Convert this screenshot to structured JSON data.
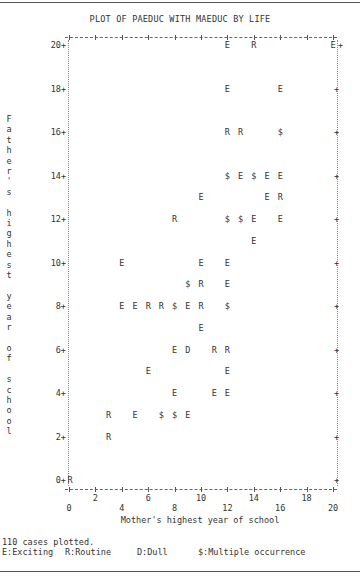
{
  "chart_data": {
    "type": "scatter",
    "title": "PLOT OF PAEDUC WITH MAEDUC BY LIFE",
    "xlabel": "Mother's highest year of school",
    "ylabel": "Father's highest year of school",
    "xlim": [
      0,
      20
    ],
    "ylim": [
      0,
      20
    ],
    "x_ticks": [
      0,
      2,
      4,
      6,
      8,
      10,
      12,
      14,
      16,
      18,
      20
    ],
    "y_ticks": [
      0,
      2,
      4,
      6,
      8,
      10,
      12,
      14,
      16,
      18,
      20
    ],
    "grid": false,
    "legend": [
      {
        "symbol": "E",
        "label": "Exciting"
      },
      {
        "symbol": "R",
        "label": "Routine"
      },
      {
        "symbol": "D",
        "label": "Dull"
      },
      {
        "symbol": "$",
        "label": "Multiple occurrence"
      }
    ],
    "points": [
      {
        "x": 12,
        "y": 20,
        "s": "E"
      },
      {
        "x": 14,
        "y": 20,
        "s": "R"
      },
      {
        "x": 20,
        "y": 20,
        "s": "E"
      },
      {
        "x": 12,
        "y": 18,
        "s": "E"
      },
      {
        "x": 16,
        "y": 18,
        "s": "E"
      },
      {
        "x": 12,
        "y": 16,
        "s": "R"
      },
      {
        "x": 13,
        "y": 16,
        "s": "R"
      },
      {
        "x": 16,
        "y": 16,
        "s": "$"
      },
      {
        "x": 12,
        "y": 14,
        "s": "$"
      },
      {
        "x": 13,
        "y": 14,
        "s": "E"
      },
      {
        "x": 14,
        "y": 14,
        "s": "$"
      },
      {
        "x": 15,
        "y": 14,
        "s": "E"
      },
      {
        "x": 16,
        "y": 14,
        "s": "E"
      },
      {
        "x": 10,
        "y": 13,
        "s": "E"
      },
      {
        "x": 15,
        "y": 13,
        "s": "E"
      },
      {
        "x": 16,
        "y": 13,
        "s": "R"
      },
      {
        "x": 8,
        "y": 12,
        "s": "R"
      },
      {
        "x": 12,
        "y": 12,
        "s": "$"
      },
      {
        "x": 13,
        "y": 12,
        "s": "$"
      },
      {
        "x": 14,
        "y": 12,
        "s": "E"
      },
      {
        "x": 16,
        "y": 12,
        "s": "E"
      },
      {
        "x": 14,
        "y": 11,
        "s": "E"
      },
      {
        "x": 4,
        "y": 10,
        "s": "E"
      },
      {
        "x": 10,
        "y": 10,
        "s": "E"
      },
      {
        "x": 12,
        "y": 10,
        "s": "E"
      },
      {
        "x": 9,
        "y": 9,
        "s": "$"
      },
      {
        "x": 10,
        "y": 9,
        "s": "R"
      },
      {
        "x": 12,
        "y": 9,
        "s": "E"
      },
      {
        "x": 4,
        "y": 8,
        "s": "E"
      },
      {
        "x": 5,
        "y": 8,
        "s": "E"
      },
      {
        "x": 6,
        "y": 8,
        "s": "R"
      },
      {
        "x": 7,
        "y": 8,
        "s": "R"
      },
      {
        "x": 8,
        "y": 8,
        "s": "$"
      },
      {
        "x": 9,
        "y": 8,
        "s": "E"
      },
      {
        "x": 10,
        "y": 8,
        "s": "R"
      },
      {
        "x": 12,
        "y": 8,
        "s": "$"
      },
      {
        "x": 10,
        "y": 7,
        "s": "E"
      },
      {
        "x": 8,
        "y": 6,
        "s": "E"
      },
      {
        "x": 9,
        "y": 6,
        "s": "D"
      },
      {
        "x": 11,
        "y": 6,
        "s": "R"
      },
      {
        "x": 12,
        "y": 6,
        "s": "R"
      },
      {
        "x": 6,
        "y": 5,
        "s": "E"
      },
      {
        "x": 12,
        "y": 5,
        "s": "E"
      },
      {
        "x": 8,
        "y": 4,
        "s": "E"
      },
      {
        "x": 11,
        "y": 4,
        "s": "E"
      },
      {
        "x": 12,
        "y": 4,
        "s": "E"
      },
      {
        "x": 3,
        "y": 3,
        "s": "R"
      },
      {
        "x": 5,
        "y": 3,
        "s": "E"
      },
      {
        "x": 7,
        "y": 3,
        "s": "$"
      },
      {
        "x": 8,
        "y": 3,
        "s": "$"
      },
      {
        "x": 9,
        "y": 3,
        "s": "E"
      },
      {
        "x": 3,
        "y": 2,
        "s": "R"
      },
      {
        "x": 0,
        "y": 0,
        "s": "R"
      }
    ],
    "cases_plotted": 110
  },
  "title": "PLOT OF PAEDUC WITH MAEDUC BY LIFE",
  "y_axis_title": "Father's highest year of school",
  "x_axis_title": "Mother's highest year of school",
  "footer": {
    "cases": "110 cases plotted.",
    "legend_e": "E:Exciting",
    "legend_r": "R:Routine",
    "legend_d": "D:Dull",
    "legend_multi": "$:Multiple occurrence"
  }
}
